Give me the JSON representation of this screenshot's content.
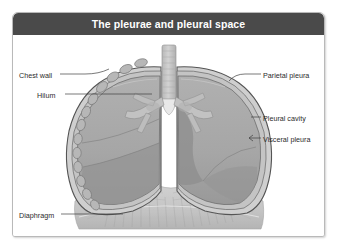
{
  "figure": {
    "title": "The pleurae and pleural space",
    "header_color": "#4a4a4a",
    "card_background": "#ffffff",
    "border_color": "#b9b9b9"
  },
  "labels": {
    "chest_wall": "Chest wall",
    "hilum": "Hilum",
    "diaphragm": "Diaphragm",
    "parietal_pleura": "Parietal pleura",
    "pleural_cavity": "Pleural cavity",
    "visceral_pleura": "Visceral pleura"
  },
  "diagram": {
    "type": "anatomical-illustration",
    "structures": [
      "trachea",
      "left-main-bronchus",
      "right-main-bronchus",
      "left-lung",
      "right-lung",
      "parietal-pleura-membrane",
      "visceral-pleura-membrane",
      "pleural-cavity-space",
      "ribs",
      "diaphragm"
    ],
    "palette": {
      "lung_fill": "#a8a8a8",
      "lung_shadow": "#8e8e8e",
      "pleura_line": "#5a5a5a",
      "pleural_cavity_fill": "#cfcfcf",
      "rib_fill": "#b5b5b5",
      "airway_fill": "#c2c2c2",
      "diaphragm_fill": "#c9c9c9",
      "leader_line": "#4a4a4a"
    }
  }
}
